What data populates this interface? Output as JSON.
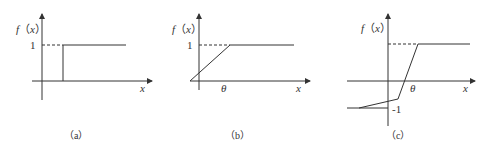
{
  "panels": [
    {
      "id": "a",
      "caption": "（a）",
      "ylabel": "f（x）",
      "xlabel": "x",
      "tick_y": "1",
      "description": "step function: 0 for x < threshold, 1 for x >= threshold"
    },
    {
      "id": "b",
      "caption": "（b）",
      "ylabel": "f（x）",
      "xlabel": "x",
      "tick_y": "1",
      "tick_x": "θ",
      "description": "linear ramp rising to saturation at 1"
    },
    {
      "id": "c",
      "caption": "（c）",
      "ylabel": "f（x）",
      "xlabel": "x",
      "tick_y_neg": "-1",
      "tick_x": "θ",
      "description": "piecewise linear from -1 to 1 crossing zero at θ"
    }
  ]
}
